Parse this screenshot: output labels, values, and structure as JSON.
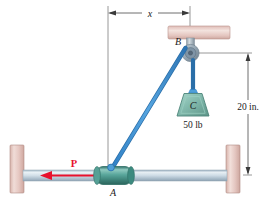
{
  "figure": {
    "type": "statics-free-body-diagram",
    "background_color": "#ffffff"
  },
  "labels": {
    "point_a": "A",
    "point_b": "B",
    "point_c": "C",
    "force_p": "P",
    "weight_c": "50 lb",
    "dim_x": "x",
    "dim_vertical": "20 in."
  },
  "dimensions": {
    "horizontal": {
      "label": "x",
      "from": "collar-A-vertical-axis",
      "to": "pulley-B-vertical-axis"
    },
    "vertical": {
      "label": "20 in.",
      "from": "pulley-B-level",
      "to": "rod-level"
    }
  },
  "values": {
    "weight": 50,
    "weight_unit": "lb",
    "height": 20,
    "height_unit": "in."
  },
  "colors": {
    "cable": "#3f93d8",
    "collar": "#4e9e94",
    "weight_block": "#78b3a6",
    "support_wall": "#e2c3bd",
    "ceiling_block": "#e3c0bb",
    "rod": "#b9c9d6",
    "force_arrow": "#e8112d",
    "pulley": "#9aa9b4",
    "dimension_line": "#6a6a6a"
  },
  "parts": {
    "left_wall": "left-wall-support",
    "right_wall": "right-wall-support",
    "ceiling": "ceiling-block",
    "rod": "horizontal-rod",
    "collar": "collar-A",
    "pulley": "pulley-B",
    "block": "block-C",
    "cable_diagonal": "cable-A-to-B",
    "cable_vertical": "cable-B-to-C"
  }
}
